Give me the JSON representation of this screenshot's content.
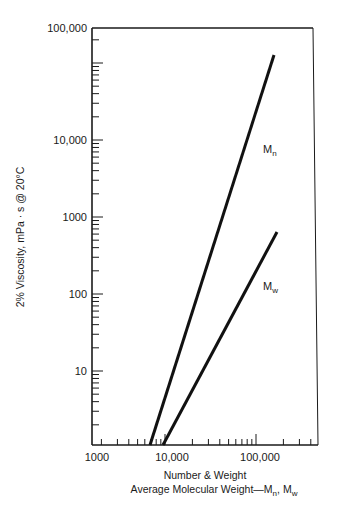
{
  "chart_data": {
    "type": "line",
    "title": "",
    "xlabel": "Number & Weight Average Molecular Weight—Mn, Mw",
    "xlabel_lines": [
      "Number & Weight",
      "Average Molecular Weight—M",
      "n",
      ", M",
      "w"
    ],
    "ylabel": "2% Viscosity, mPa · s @ 20°C",
    "xscale": "log",
    "yscale": "log",
    "xlim": [
      1000,
      500000
    ],
    "ylim": [
      1,
      100000
    ],
    "x_ticks": [
      "1000",
      "10,000",
      "100,000"
    ],
    "y_ticks": [
      "100,000",
      "10,000",
      "1000",
      "100",
      "10"
    ],
    "grid": false,
    "legend": "inline labels",
    "series": [
      {
        "name": "Mn",
        "label_main": "M",
        "label_sub": "n",
        "points": [
          [
            6800,
            1.1
          ],
          [
            160000,
            60000
          ]
        ]
      },
      {
        "name": "Mw",
        "label_main": "M",
        "label_sub": "w",
        "points": [
          [
            9500,
            1.1
          ],
          [
            175000,
            640
          ]
        ]
      }
    ]
  }
}
